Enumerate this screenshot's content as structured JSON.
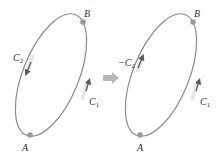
{
  "colors": {
    "curve": "#8a8a8a",
    "point": "#9a9a9a",
    "arrow": "#5a5a5a",
    "highlight": "#e6e6e6",
    "transform_arrow": "#b8b8b8",
    "text": "#333333"
  },
  "left_diagram": {
    "point_a": {
      "label": "A"
    },
    "point_b": {
      "label": "B"
    },
    "path_c1": {
      "label": "C",
      "subscript": "1",
      "direction": "A to B"
    },
    "path_c2": {
      "label": "C",
      "subscript": "2",
      "direction": "B to A"
    }
  },
  "transform_arrow": {
    "icon": "right-arrow-icon"
  },
  "right_diagram": {
    "point_a": {
      "label": "A"
    },
    "point_b": {
      "label": "B"
    },
    "path_c1": {
      "label": "C",
      "subscript": "1",
      "direction": "A to B"
    },
    "path_neg_c2": {
      "label": "−C",
      "subscript": "2",
      "direction": "A to B"
    }
  }
}
